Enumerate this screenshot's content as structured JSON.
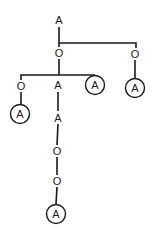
{
  "diagram": {
    "type": "tree",
    "nodes": [
      {
        "id": "n1",
        "label": "A",
        "circled": false,
        "x": 59,
        "y": 20
      },
      {
        "id": "n2",
        "label": "O",
        "circled": false,
        "x": 59,
        "y": 53
      },
      {
        "id": "n3",
        "label": "O",
        "circled": false,
        "x": 135,
        "y": 54
      },
      {
        "id": "n4",
        "label": "A",
        "circled": true,
        "x": 135,
        "y": 88
      },
      {
        "id": "n5",
        "label": "O",
        "circled": false,
        "x": 21,
        "y": 86
      },
      {
        "id": "n6",
        "label": "A",
        "circled": false,
        "x": 58,
        "y": 85
      },
      {
        "id": "n7",
        "label": "A",
        "circled": true,
        "x": 95,
        "y": 85
      },
      {
        "id": "n8",
        "label": "A",
        "circled": true,
        "x": 20,
        "y": 114
      },
      {
        "id": "n9",
        "label": "A",
        "circled": false,
        "x": 58,
        "y": 118
      },
      {
        "id": "n10",
        "label": "O",
        "circled": false,
        "x": 57,
        "y": 151
      },
      {
        "id": "n11",
        "label": "O",
        "circled": false,
        "x": 57,
        "y": 181
      },
      {
        "id": "n12",
        "label": "A",
        "circled": true,
        "x": 56,
        "y": 214
      }
    ],
    "edges": [
      [
        "n1",
        "n2"
      ],
      [
        "n1",
        "n3"
      ],
      [
        "n3",
        "n4"
      ],
      [
        "n2",
        "n5"
      ],
      [
        "n2",
        "n6"
      ],
      [
        "n2",
        "n7"
      ],
      [
        "n5",
        "n8"
      ],
      [
        "n6",
        "n9"
      ],
      [
        "n9",
        "n10"
      ],
      [
        "n10",
        "n11"
      ],
      [
        "n11",
        "n12"
      ]
    ]
  }
}
